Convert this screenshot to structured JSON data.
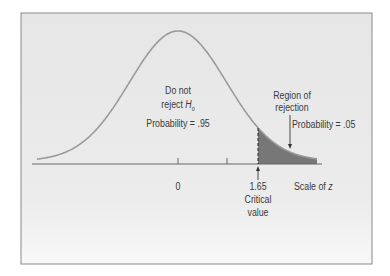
{
  "chart_data": {
    "type": "area",
    "title": "",
    "xlabel": "Scale of z",
    "ylabel": "",
    "ticks": [
      {
        "z": 0,
        "label": "0"
      },
      {
        "z": 0.8,
        "label": ""
      },
      {
        "z": 1.65,
        "label": "1.65"
      }
    ],
    "critical_value": 1.65,
    "regions": [
      {
        "name": "Do not reject H0",
        "probability": 0.95,
        "z_range": [
          -3.5,
          1.65
        ]
      },
      {
        "name": "Region of rejection",
        "probability": 0.05,
        "z_range": [
          1.65,
          3.5
        ]
      }
    ],
    "grid": false,
    "legend": "none"
  },
  "labels": {
    "accept_line1": "Do not",
    "accept_line2": "reject ",
    "h0_main": "H",
    "h0_sub": "0",
    "accept_prob": "Probability = .95",
    "reject_line1": "Region of",
    "reject_line2": "rejection",
    "reject_prob": "Probability = .05",
    "tick_zero": "0",
    "tick_critical": "1.65",
    "critical_line1": "Critical",
    "critical_line2": "value",
    "axis_title": "Scale of ",
    "axis_var": "z"
  },
  "colors": {
    "background": "#e9e9e9",
    "frame": "#8a8a8a",
    "curve": "#9a9a9a",
    "shaded": "#777777",
    "axis": "#666666",
    "text": "#3a3a3a"
  }
}
